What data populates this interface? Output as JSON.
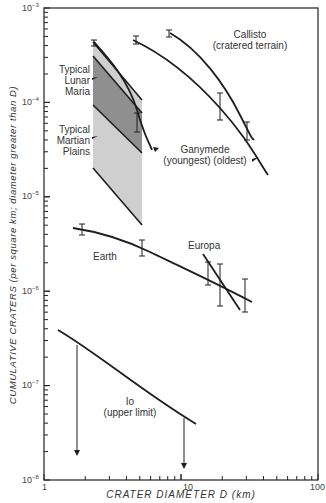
{
  "chart_data": {
    "type": "line",
    "title": "",
    "xlabel": "CRATER DIAMETER D (km)",
    "ylabel": "CUMULATIVE CRATERS (per square km; diameter greater than D)",
    "xscale": "log",
    "yscale": "log",
    "xlim": [
      1,
      100
    ],
    "ylim": [
      1e-08,
      0.001
    ],
    "x_tick_labels": [
      "1",
      "10",
      "100"
    ],
    "y_tick_labels": [
      "10^-3",
      "10^-4",
      "10^-5",
      "10^-6",
      "10^-7",
      "10^-8"
    ],
    "grid": false,
    "series": [
      {
        "name": "Callisto (cratered terrain)",
        "x": [
          7.5,
          12,
          20,
          30
        ],
        "y": [
          0.00055,
          0.00032,
          0.00012,
          4.5e-05
        ],
        "error_bars_at_x": [
          7.5,
          30
        ]
      },
      {
        "name": "Ganymede (oldest)",
        "x": [
          4.6,
          8,
          14,
          20,
          40
        ],
        "y": [
          0.00046,
          0.00028,
          0.00013,
          7.5e-05,
          2.5e-05
        ],
        "error_bars_at_x": [
          4.6,
          20
        ]
      },
      {
        "name": "Ganymede (youngest)",
        "x": [
          2.2,
          3.5,
          5,
          6
        ],
        "y": [
          0.00043,
          0.0002,
          6.5e-05,
          3.3e-05
        ],
        "error_bars_at_x": [
          2.2,
          5
        ]
      },
      {
        "name": "Typical Lunar Maria",
        "type": "band",
        "x": [
          2.3,
          5.2
        ],
        "upper": [
          0.00044,
          0.00011
        ],
        "lower": [
          0.00029,
          2.9e-05
        ]
      },
      {
        "name": "Typical Martian Plains",
        "type": "band",
        "x": [
          2.3,
          5.2
        ],
        "upper": [
          0.00044,
          0.00011
        ],
        "lower": [
          2e-05,
          5e-06
        ]
      },
      {
        "name": "Earth",
        "x": [
          1.8,
          3,
          5,
          8,
          12,
          20,
          30
        ],
        "y": [
          4.5e-06,
          4e-06,
          3e-06,
          2.2e-06,
          1.5e-06,
          1e-06,
          7.5e-07
        ],
        "error_bars_at_x": [
          1.9,
          5,
          15,
          20,
          30
        ]
      },
      {
        "name": "Europa",
        "x": [
          13,
          26
        ],
        "y": [
          2e-06,
          6e-07
        ],
        "error_bars_at_x": [
          15,
          20
        ]
      },
      {
        "name": "Io (upper limit)",
        "x": [
          1.3,
          1.7,
          3,
          5,
          9,
          10
        ],
        "y": [
          4e-07,
          3e-07,
          1.6e-07,
          9e-08,
          5e-08,
          4.5e-08
        ],
        "upper_limit_arrows_at_x": [
          1.7,
          9
        ]
      }
    ],
    "annotations": [
      "Callisto (cratered terrain)",
      "Ganymede (youngest) (oldest)",
      "Typical Lunar Maria",
      "Typical Martian Plains",
      "Earth",
      "Europa",
      "Io (upper limit)"
    ]
  },
  "labels": {
    "callisto_1": "Callisto",
    "callisto_2": "(cratered terrain)",
    "ganymede_1": "Ganymede",
    "ganymede_2": "(youngest)  (oldest)",
    "lunar_1": "Typical",
    "lunar_2": "Lunar",
    "lunar_3": "Maria",
    "martian_1": "Typical",
    "martian_2": "Martian",
    "martian_3": "Plains",
    "earth": "Earth",
    "europa": "Europa",
    "io_1": "Io",
    "io_2": "(upper limit)"
  },
  "axes": {
    "x_title": "CRATER DIAMETER D  (km)",
    "y_title": "CUMULATIVE CRATERS  (per square km; diameter greater than D)",
    "x_ticks": [
      "1",
      "10",
      "100"
    ],
    "y_ticks": [
      {
        "base": "10",
        "exp": "−3"
      },
      {
        "base": "10",
        "exp": "−4"
      },
      {
        "base": "10",
        "exp": "−5"
      },
      {
        "base": "10",
        "exp": "−6"
      },
      {
        "base": "10",
        "exp": "−7"
      },
      {
        "base": "10",
        "exp": "−8"
      }
    ]
  },
  "colors": {
    "line": "#1e1e1e",
    "band_dark": "#8f8f8f",
    "band_light": "#cfcfcf",
    "frame": "#222222"
  }
}
